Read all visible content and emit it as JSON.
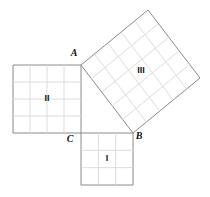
{
  "figure": {
    "background_color": "#ffffff",
    "border_color": "#8a8a8a",
    "grid_color": "#dcdcdc",
    "label_color": "#111111"
  },
  "vertices": [
    {
      "name": "A",
      "label": "A",
      "x": 81,
      "y": 65,
      "label_x": 74,
      "label_y": 54
    },
    {
      "name": "B",
      "label": "B",
      "x": 133,
      "y": 133,
      "label_x": 139,
      "label_y": 137
    },
    {
      "name": "C",
      "label": "C",
      "x": 81,
      "y": 133,
      "label_x": 70,
      "label_y": 140
    }
  ],
  "squares": [
    {
      "id": "square-1",
      "label": "I",
      "kind": "axis-aligned",
      "divisions": 3,
      "side": 52,
      "x": 81,
      "y": 133,
      "label_x": 107,
      "label_y": 159,
      "corners": [
        [
          81,
          133
        ],
        [
          133,
          133
        ],
        [
          133,
          185
        ],
        [
          81,
          185
        ]
      ]
    },
    {
      "id": "square-2",
      "label": "II",
      "kind": "axis-aligned",
      "divisions": 4,
      "side": 68,
      "x": 13,
      "y": 65,
      "label_x": 47,
      "label_y": 99,
      "corners": [
        [
          13,
          65
        ],
        [
          81,
          65
        ],
        [
          81,
          133
        ],
        [
          13,
          133
        ]
      ]
    },
    {
      "id": "square-3",
      "label": "III",
      "kind": "rotated",
      "divisions": 5,
      "side": 85.6,
      "label_x": 141,
      "label_y": 71,
      "corners": [
        [
          81,
          65
        ],
        [
          148,
          10
        ],
        [
          200,
          78
        ],
        [
          133,
          133
        ]
      ]
    }
  ]
}
